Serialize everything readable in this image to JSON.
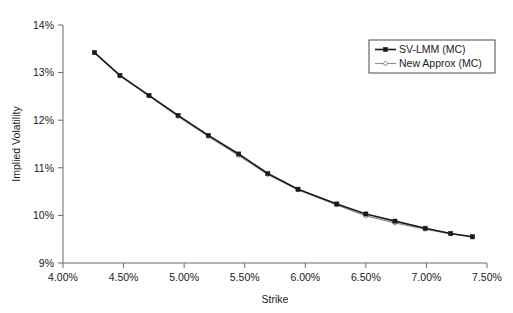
{
  "chart_data": {
    "type": "line",
    "title": "",
    "xlabel": "Strike",
    "ylabel": "Implied Volatility",
    "xlim": [
      4.0,
      7.5
    ],
    "ylim": [
      9.0,
      14.0
    ],
    "grid": false,
    "legend_position": "top-right",
    "x_tick_labels": [
      "4.00%",
      "4.50%",
      "5.00%",
      "5.50%",
      "6.00%",
      "6.50%",
      "7.00%",
      "7.50%"
    ],
    "x_tick_values": [
      4.0,
      4.5,
      5.0,
      5.5,
      6.0,
      6.5,
      7.0,
      7.5
    ],
    "y_tick_labels": [
      "9%",
      "10%",
      "11%",
      "12%",
      "13%",
      "14%"
    ],
    "y_tick_values": [
      9,
      10,
      11,
      12,
      13,
      14
    ],
    "x": [
      4.26,
      4.47,
      4.71,
      4.95,
      5.2,
      5.45,
      5.69,
      5.94,
      6.26,
      6.5,
      6.74,
      6.99,
      7.2,
      7.38
    ],
    "series": [
      {
        "name": "SV-LMM (MC)",
        "color": "#1a1a1a",
        "marker": "filled-square",
        "values": [
          13.42,
          12.94,
          12.52,
          12.1,
          11.68,
          11.29,
          10.88,
          10.55,
          10.24,
          10.03,
          9.88,
          9.73,
          9.62,
          9.55
        ]
      },
      {
        "name": "New Approx (MC)",
        "color": "#8d8d8d",
        "marker": "open-circle",
        "values": [
          13.42,
          12.93,
          12.51,
          12.08,
          11.66,
          11.26,
          10.86,
          10.54,
          10.22,
          9.99,
          9.84,
          9.71,
          9.61,
          9.55
        ]
      }
    ]
  },
  "legend": {
    "entries": [
      {
        "label": "SV-LMM (MC)"
      },
      {
        "label": "New Approx (MC)"
      }
    ]
  },
  "axes": {
    "x_title": "Strike",
    "y_title": "Implied Volatility"
  }
}
